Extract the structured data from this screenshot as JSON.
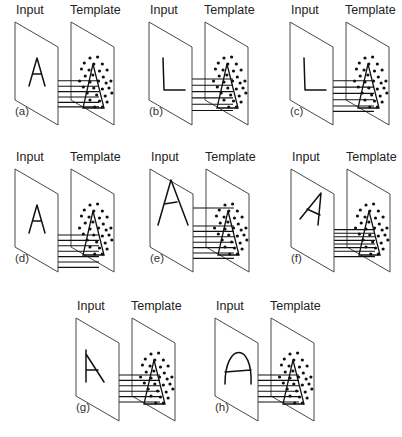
{
  "labels": {
    "input": "Input",
    "template": "Template"
  },
  "panels": [
    {
      "id": "a",
      "label": "(a)",
      "input_letter": "A",
      "x": 15,
      "y": 22,
      "rays": [
        32,
        38,
        44,
        50,
        56,
        61
      ]
    },
    {
      "id": "b",
      "label": "(b)",
      "input_letter": "L",
      "x": 149,
      "y": 22,
      "rays": [
        30,
        37,
        44,
        51,
        58,
        65
      ]
    },
    {
      "id": "c",
      "label": "(c)",
      "input_letter": "L",
      "x": 290,
      "y": 22,
      "rays": [
        32,
        39,
        46,
        53,
        60,
        66
      ]
    },
    {
      "id": "d",
      "label": "(d)",
      "input_letter": "A",
      "x": 15,
      "y": 169,
      "rays": [
        40,
        46,
        52,
        58,
        64,
        70,
        76
      ]
    },
    {
      "id": "e",
      "label": "(e)",
      "input_letter": "A (large)",
      "x": 150,
      "y": 169,
      "rays": [
        10,
        30,
        36,
        42,
        48,
        54,
        60,
        66
      ]
    },
    {
      "id": "f",
      "label": "(f)",
      "input_letter": "A (rotated)",
      "x": 291,
      "y": 169,
      "rays": [
        34,
        38,
        42,
        46,
        50,
        54,
        58,
        64
      ]
    },
    {
      "id": "g",
      "label": "(g)",
      "input_letter": "A (no crossbar left stroke)",
      "x": 76,
      "y": 318,
      "rays": [
        30,
        36,
        42,
        48,
        54,
        60
      ]
    },
    {
      "id": "h",
      "label": "(h)",
      "input_letter": "A (rounded)",
      "x": 215,
      "y": 318,
      "rays": [
        30,
        36,
        42,
        48,
        54,
        60
      ]
    }
  ]
}
